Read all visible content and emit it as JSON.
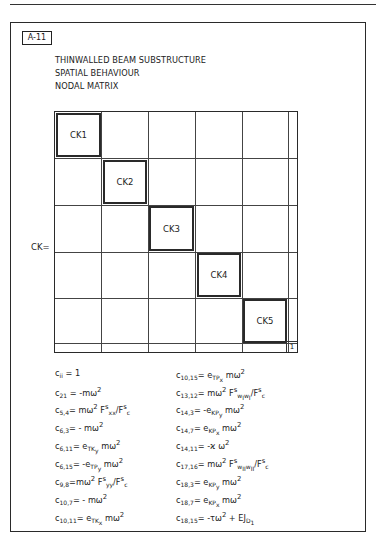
{
  "document": {
    "tag": "A-11",
    "title_lines": [
      "THINWALLED BEAM SUBSTRUCTURE",
      "SPATIAL BEHAVIOUR",
      "NODAL MATRIX"
    ],
    "matrix_label": "CK=",
    "blocks": [
      "CK1",
      "CK2",
      "CK3",
      "CK4",
      "CK5"
    ],
    "corner_label": "1",
    "equations_left": [
      "cii = 1",
      "c21 = -mω²",
      "c5,4 = mω² F^s_xx / F^s_c",
      "c6,3 = -mω²",
      "c6,11 = e_TKy mω²",
      "c6,15 = -e_TPy mω²",
      "c9,8 = mω² F^s_yy / F^s_c",
      "c10,7 = -mω²",
      "c10,11 = e_TKx mω²"
    ],
    "equations_right": [
      "c10,15 = e_TPx mω²",
      "c13,12 = mω² F^s_wIwI / F^s_c",
      "c14,3 = -e_KPy mω²",
      "c14,7 = e_KPx mω²",
      "c14,11 = -ϰ ω²",
      "c17,16 = mω² F^s_wIIwII / F^s_c",
      "c18,3 = e_KPy mω²",
      "c18,7 = e_KPx mω²",
      "c18,15 = -τω² + EJ_D1"
    ]
  }
}
